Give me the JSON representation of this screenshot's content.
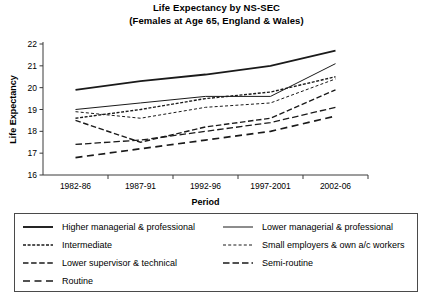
{
  "title": {
    "line1": "Life Expectancy by NS-SEC",
    "line2": "(Females at Age 65, England & Wales)"
  },
  "chart_data": {
    "type": "line",
    "title": "Life Expectancy by NS-SEC (Females at Age 65, England & Wales)",
    "xlabel": "Period",
    "ylabel": "Life Expectancy",
    "categories": [
      "1982-86",
      "1987-91",
      "1992-96",
      "1997-2001",
      "2002-06"
    ],
    "ylim": [
      16,
      22
    ],
    "yticks": [
      16,
      17,
      18,
      19,
      20,
      21,
      22
    ],
    "grid": false,
    "legend_position": "below",
    "series": [
      {
        "name": "Higher managerial & professional",
        "style": "solid-thick",
        "values": [
          19.9,
          20.3,
          20.6,
          21.0,
          21.7
        ]
      },
      {
        "name": "Lower managerial & professional",
        "style": "solid-thin",
        "values": [
          19.0,
          19.3,
          19.6,
          19.6,
          21.1
        ]
      },
      {
        "name": "Intermediate",
        "style": "dotted",
        "values": [
          18.6,
          19.0,
          19.5,
          19.8,
          20.5
        ]
      },
      {
        "name": "Small employers & own a/c workers",
        "style": "fine-dashed",
        "values": [
          18.9,
          18.6,
          19.1,
          19.3,
          20.4
        ]
      },
      {
        "name": "Lower supervisor & technical",
        "style": "dashed-medium",
        "values": [
          18.5,
          17.5,
          18.2,
          18.6,
          19.9
        ]
      },
      {
        "name": "Semi-routine",
        "style": "dashed-long",
        "values": [
          17.4,
          17.6,
          18.0,
          18.4,
          19.1
        ]
      },
      {
        "name": "Routine",
        "style": "dashed-wide",
        "values": [
          16.8,
          17.2,
          17.6,
          18.0,
          18.7
        ]
      }
    ]
  },
  "legend": {
    "items": [
      {
        "label": "Higher managerial & professional",
        "style": "solid-thick"
      },
      {
        "label": "Lower managerial & professional",
        "style": "solid-thin"
      },
      {
        "label": "Intermediate",
        "style": "dotted"
      },
      {
        "label": "Small employers & own a/c workers",
        "style": "fine-dashed"
      },
      {
        "label": "Lower supervisor & technical",
        "style": "dashed-medium"
      },
      {
        "label": "Semi-routine",
        "style": "dashed-long"
      },
      {
        "label": "Routine",
        "style": "dashed-wide"
      }
    ]
  }
}
